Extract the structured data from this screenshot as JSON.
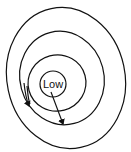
{
  "diagram": {
    "type": "isobar-low-pressure",
    "center_label": "Low",
    "isobar_count": 4,
    "arrow_count": 2,
    "colors": {
      "stroke": "#111111",
      "background": "#ffffff"
    }
  }
}
